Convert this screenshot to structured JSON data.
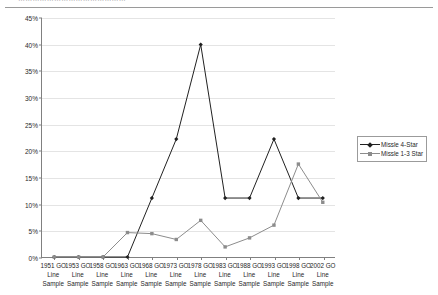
{
  "header": {
    "clipped_text": "………………………………………",
    "rule_color": "#9a9a9a"
  },
  "legend": {
    "position": "right",
    "entries": [
      {
        "label": "Missle 4-Star",
        "color": "#202020",
        "marker": "diamond"
      },
      {
        "label": "Missle 1-3 Star",
        "color": "#8c8c8c",
        "marker": "square"
      }
    ]
  },
  "axes": {
    "y_ticks": [
      "0%",
      "5%",
      "10%",
      "15%",
      "20%",
      "25%",
      "30%",
      "35%",
      "40%",
      "45%"
    ],
    "x_labels": [
      "1951 GO\nLine\nSample",
      "1953 GO\nLine\nSample",
      "1958 GO\nLine\nSample",
      "1963 GO\nLine\nSample",
      "1968 GO\nLine\nSample",
      "1973 GO\nLine\nSample",
      "1978 GO\nLine\nSample",
      "1983 GO\nLine\nSample",
      "1988 GO\nLine\nSample",
      "1993 GO\nLine\nSample",
      "1998 GO\nLine\nSample",
      "2002 GO\nLine\nSample"
    ]
  },
  "chart_data": {
    "type": "line",
    "title": "",
    "xlabel": "",
    "ylabel": "",
    "ylim": [
      0,
      45
    ],
    "ytick_step": 5,
    "ytick_format": "percent",
    "grid": true,
    "legend_position": "right",
    "categories": [
      "1951 GO Line Sample",
      "1953 GO Line Sample",
      "1958 GO Line Sample",
      "1963 GO Line Sample",
      "1968 GO Line Sample",
      "1973 GO Line Sample",
      "1978 GO Line Sample",
      "1983 GO Line Sample",
      "1988 GO Line Sample",
      "1993 GO Line Sample",
      "1998 GO Line Sample",
      "2002 GO Line Sample"
    ],
    "series": [
      {
        "name": "Missle 4-Star",
        "color": "#202020",
        "marker": "diamond",
        "values": [
          0,
          0,
          0,
          0,
          11.1,
          22.2,
          40.0,
          11.1,
          11.1,
          22.2,
          11.1,
          11.1
        ]
      },
      {
        "name": "Missle 1-3 Star",
        "color": "#8c8c8c",
        "marker": "square",
        "values": [
          0,
          0,
          0,
          4.6,
          4.4,
          3.3,
          6.9,
          1.9,
          3.6,
          6.0,
          17.5,
          10.3
        ]
      }
    ]
  }
}
